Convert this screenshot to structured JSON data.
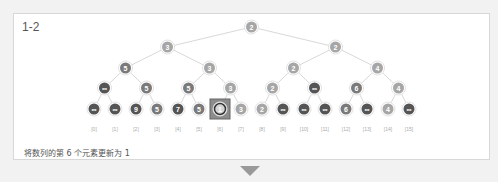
{
  "panel": {
    "title": "1-2",
    "caption": "将数列的第 6 个元素更新为 1"
  },
  "tree": {
    "levels": [
      [
        "2"
      ],
      [
        "3",
        "2"
      ],
      [
        "5",
        "3",
        "2",
        "4"
      ],
      [
        "∞",
        "5",
        "5",
        "3",
        "2",
        "∞",
        "6",
        "4"
      ],
      [
        "∞",
        "∞",
        "9",
        "5",
        "7",
        "5",
        "1",
        "3",
        "2",
        "∞",
        "∞",
        "∞",
        "6",
        "∞",
        "4",
        "∞"
      ]
    ],
    "leaf_indices": [
      "[0]",
      "[1]",
      "[2]",
      "[3]",
      "[4]",
      "[5]",
      "[6]",
      "[7]",
      "[8]",
      "[9]",
      "[10]",
      "[11]",
      "[12]",
      "[13]",
      "[14]",
      "[15]"
    ],
    "highlighted_leaf": 6
  },
  "colors": {
    "node_light": "#a6a6a6",
    "node_mid": "#7a7a7a",
    "node_dark": "#555555",
    "highlight_box": "#8c8c8c",
    "edge": "#d9d9d9"
  }
}
